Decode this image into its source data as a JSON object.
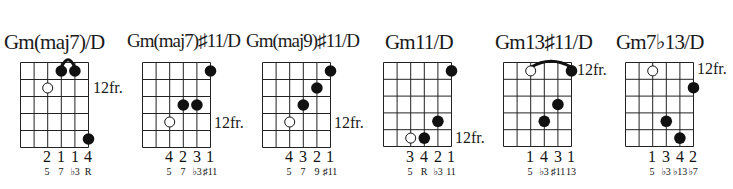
{
  "style": {
    "line_color": "#222222",
    "dot_color": "#111111",
    "open_dot_fill": "#ffffff"
  },
  "chords": [
    {
      "name": "Gm(maj7)/D",
      "fret_label": "12fr.",
      "fret_label_row": 1,
      "fingers": [
        "",
        "",
        "2",
        "1",
        "1",
        "4"
      ],
      "degrees": [
        "",
        "",
        "5",
        "7",
        "♭3",
        "R"
      ],
      "dots": [
        {
          "string": 4,
          "fret": 0.5,
          "type": "filled"
        },
        {
          "string": 5,
          "fret": 0.5,
          "type": "filled"
        },
        {
          "string": 3,
          "fret": 1.5,
          "type": "open"
        },
        {
          "string": 6,
          "fret": 4.5,
          "type": "filled"
        }
      ],
      "barre": {
        "from": 4,
        "to": 5
      }
    },
    {
      "name": "Gm(maj7)♯11/D",
      "fret_label": "12fr.",
      "fret_label_row": 3,
      "fingers": [
        "",
        "",
        "4",
        "2",
        "3",
        "1"
      ],
      "degrees": [
        "",
        "",
        "5",
        "7",
        "♭3",
        "♯11"
      ],
      "dots": [
        {
          "string": 6,
          "fret": 0.5,
          "type": "filled"
        },
        {
          "string": 4,
          "fret": 2.5,
          "type": "filled"
        },
        {
          "string": 5,
          "fret": 2.5,
          "type": "filled"
        },
        {
          "string": 3,
          "fret": 3.5,
          "type": "open"
        }
      ],
      "barre": null
    },
    {
      "name": "Gm(maj9)♯11/D",
      "fret_label": "12fr.",
      "fret_label_row": 3,
      "fingers": [
        "",
        "",
        "4",
        "3",
        "2",
        "1"
      ],
      "degrees": [
        "",
        "",
        "5",
        "7",
        "9",
        "♯11"
      ],
      "dots": [
        {
          "string": 6,
          "fret": 0.5,
          "type": "filled"
        },
        {
          "string": 5,
          "fret": 1.5,
          "type": "filled"
        },
        {
          "string": 4,
          "fret": 2.5,
          "type": "filled"
        },
        {
          "string": 3,
          "fret": 3.5,
          "type": "open"
        }
      ],
      "barre": null
    },
    {
      "name": "Gm11/D",
      "fret_label": "12fr.",
      "fret_label_row": 4,
      "fingers": [
        "",
        "",
        "3",
        "4",
        "2",
        "1"
      ],
      "degrees": [
        "",
        "",
        "5",
        "R",
        "♭3",
        "11"
      ],
      "dots": [
        {
          "string": 6,
          "fret": 0.5,
          "type": "filled"
        },
        {
          "string": 5,
          "fret": 3.5,
          "type": "filled"
        },
        {
          "string": 3,
          "fret": 4.5,
          "type": "open"
        },
        {
          "string": 4,
          "fret": 4.5,
          "type": "filled"
        }
      ],
      "barre": null
    },
    {
      "name": "Gm13♯11/D",
      "fret_label": "12fr.",
      "fret_label_row": 0,
      "fingers": [
        "",
        "",
        "1",
        "4",
        "3",
        "1"
      ],
      "degrees": [
        "",
        "",
        "5",
        "♭3",
        "♯11",
        "13"
      ],
      "dots": [
        {
          "string": 3,
          "fret": 0.5,
          "type": "open"
        },
        {
          "string": 6,
          "fret": 0.5,
          "type": "filled"
        },
        {
          "string": 5,
          "fret": 2.5,
          "type": "filled"
        },
        {
          "string": 4,
          "fret": 3.5,
          "type": "filled"
        }
      ],
      "barre": {
        "from": 3,
        "to": 6
      }
    },
    {
      "name": "Gm7♭13/D",
      "fret_label": "12fr.",
      "fret_label_row": 0,
      "fingers": [
        "",
        "",
        "1",
        "3",
        "4",
        "2"
      ],
      "degrees": [
        "",
        "",
        "5",
        "♭3",
        "♭13",
        "♭7"
      ],
      "dots": [
        {
          "string": 3,
          "fret": 0.5,
          "type": "open"
        },
        {
          "string": 6,
          "fret": 1.5,
          "type": "filled"
        },
        {
          "string": 4,
          "fret": 3.5,
          "type": "filled"
        },
        {
          "string": 5,
          "fret": 4.5,
          "type": "filled"
        }
      ],
      "barre": null
    }
  ]
}
